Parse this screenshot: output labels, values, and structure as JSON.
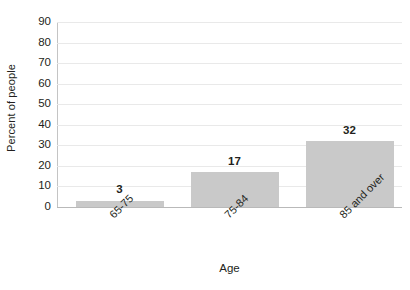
{
  "chart_data": {
    "type": "bar",
    "title": "",
    "categories": [
      "65-75",
      "75-84",
      "85 and over"
    ],
    "values": [
      3,
      17,
      32
    ],
    "series": [
      {
        "name": "Percent of people",
        "values": [
          3,
          17,
          32
        ]
      }
    ],
    "xlabel": "Age",
    "ylabel": "Percent of people",
    "ylim": [
      0,
      90
    ],
    "y_ticks": [
      0,
      10,
      20,
      30,
      40,
      50,
      60,
      70,
      80,
      90
    ],
    "y_tick_labels": [
      "0",
      "10",
      "20",
      "30",
      "40",
      "50",
      "60",
      "70",
      "80",
      "90"
    ],
    "data_labels": [
      "3",
      "17",
      "32"
    ],
    "grid": "horizontal",
    "legend": "none",
    "bar_color": "#c9c9c9",
    "gridline_color": "#e9e9e9",
    "axis_color": "#b9b9b9",
    "text_color": "#231f20",
    "background_color": "#ffffff",
    "x_tick_label_rotation": -45
  }
}
